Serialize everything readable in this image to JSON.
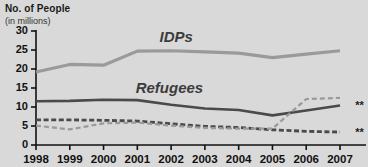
{
  "header": {
    "title": "No. of People",
    "subtitle": "(in millions)"
  },
  "chart_data": {
    "type": "line",
    "title": "No. of People",
    "subtitle": "(in millions)",
    "xlabel": "",
    "ylabel": "No. of People (in millions)",
    "x": [
      1998,
      1999,
      2000,
      2001,
      2002,
      2003,
      2004,
      2005,
      2006,
      2007
    ],
    "categories": [
      "1998",
      "1999",
      "2000",
      "2001",
      "2002",
      "2003",
      "2004",
      "2005",
      "2006",
      "2007"
    ],
    "ylim": [
      0,
      30
    ],
    "yticks": [
      0,
      5,
      10,
      15,
      20,
      25,
      30
    ],
    "ytick_labels": [
      "0",
      "5",
      "10",
      "15",
      "20",
      "25",
      "30"
    ],
    "grid": false,
    "legend": "inline-labels",
    "series": [
      {
        "name": "IDPs",
        "style": "solid-thick-light",
        "color": "#9a9a9a",
        "label_text": "IDPs",
        "values": [
          19.2,
          21.2,
          21.0,
          24.7,
          24.8,
          24.5,
          24.2,
          23.0,
          23.9,
          24.8
        ]
      },
      {
        "name": "Refugees",
        "style": "solid-dark",
        "color": "#4a4a4a",
        "label_text": "Refugees",
        "end_marker": "**",
        "values": [
          11.5,
          11.6,
          11.9,
          11.8,
          10.6,
          9.6,
          9.2,
          7.8,
          9.1,
          10.4
        ]
      },
      {
        "name": "series-dashed-dark",
        "style": "dashed-dark",
        "color": "#4a4a4a",
        "end_marker": "**",
        "values": [
          6.6,
          6.6,
          6.5,
          6.3,
          5.6,
          4.9,
          4.6,
          4.0,
          3.6,
          3.4
        ]
      },
      {
        "name": "series-dashed-light",
        "style": "dashed-light",
        "color": "#9a9a9a",
        "values": [
          5.1,
          4.1,
          5.7,
          5.9,
          5.1,
          4.5,
          4.3,
          4.3,
          12.1,
          12.4
        ]
      }
    ],
    "annotations": [
      {
        "text": "IDPs",
        "x": 2002.15,
        "y": 27.2
      },
      {
        "text": "Refugees",
        "x": 2001.95,
        "y": 13.6
      },
      {
        "text": "**",
        "x": 2007.45,
        "y": 10.4
      },
      {
        "text": "**",
        "x": 2007.45,
        "y": 3.4
      }
    ]
  },
  "axis": {
    "y_labels": [
      "30",
      "25",
      "20",
      "15",
      "10",
      "5",
      "0"
    ],
    "x_labels": [
      "1998",
      "1999",
      "2000",
      "2001",
      "2002",
      "2003",
      "2004",
      "2005",
      "2006",
      "2007"
    ]
  },
  "marks": {
    "refugees_footnote": "**",
    "dashed_footnote": "**"
  }
}
